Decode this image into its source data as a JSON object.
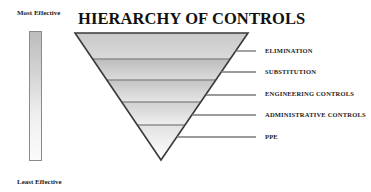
{
  "title": "HIERARCHY OF CONTROLS",
  "scale": {
    "top_label": "Most Effective",
    "bottom_label": "Least Effective"
  },
  "levels": [
    {
      "label": "ELIMINATION"
    },
    {
      "label": "SUBSTITUTION"
    },
    {
      "label": "ENGINEERING CONTROLS"
    },
    {
      "label": "ADMINISTRATIVE CONTROLS"
    },
    {
      "label": "PPE"
    }
  ],
  "colors": {
    "outline": "#3a3a3a",
    "band_top": "#c4c4c4",
    "band_bottom": "#ffffff",
    "leader": "#7a7a7a"
  }
}
